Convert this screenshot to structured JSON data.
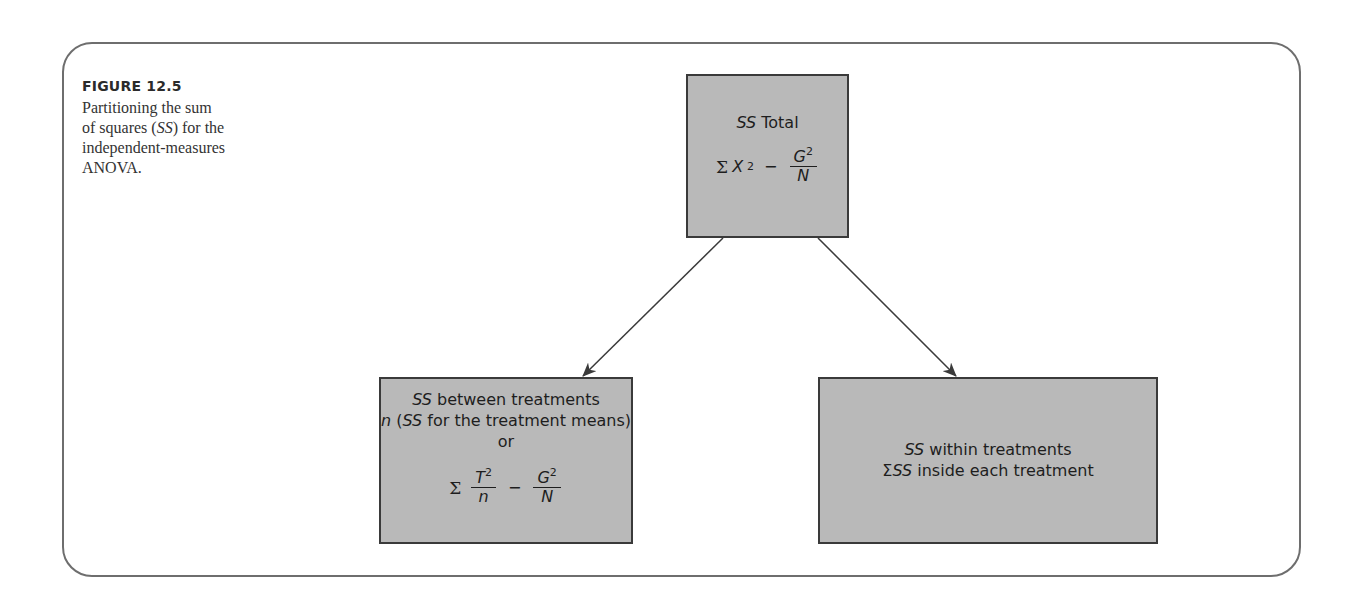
{
  "figure": {
    "label": "FIGURE 12.5",
    "caption_lines": [
      "Partitioning the sum",
      "of squares (",
      "SS",
      ") for the",
      "independent-measures",
      "ANOVA."
    ],
    "caption_full": "Partitioning the sum of squares (SS) for the independent-measures ANOVA."
  },
  "diagram": {
    "total": {
      "title_italic": "SS",
      "title_rest": " Total",
      "formula": {
        "sigma": "Σ",
        "term": "X",
        "term_exp": "2",
        "minus": "−",
        "frac_num": "G",
        "frac_num_exp": "2",
        "frac_den": "N"
      }
    },
    "between": {
      "title_italic": "SS",
      "title_rest": " between treatments",
      "line2_n": "n",
      "line2_open": " (",
      "line2_ss": "SS",
      "line2_rest": " for the treatment means)",
      "or": "or",
      "formula": {
        "sigma": "Σ",
        "frac1_num": "T",
        "frac1_num_exp": "2",
        "frac1_den": "n",
        "minus": "−",
        "frac2_num": "G",
        "frac2_num_exp": "2",
        "frac2_den": "N"
      }
    },
    "within": {
      "title_italic": "SS",
      "title_rest": " within treatments",
      "line2_sigma": "Σ",
      "line2_ss": "SS",
      "line2_rest": " inside each treatment"
    },
    "edges": [
      {
        "from": "total",
        "to": "between"
      },
      {
        "from": "total",
        "to": "within"
      }
    ],
    "colors": {
      "box_fill": "#b9b9b9",
      "box_border": "#3a3a3a",
      "frame_border": "#6e6e6e",
      "arrow": "#3a3a3a"
    }
  }
}
